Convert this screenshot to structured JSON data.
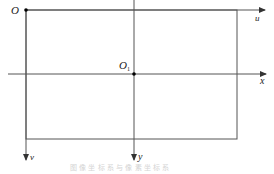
{
  "diagram": {
    "type": "coordinate-systems",
    "origins": [
      {
        "id": "pixel-origin",
        "label": "O",
        "x": 26,
        "y": 10
      },
      {
        "id": "image-origin",
        "label": "O",
        "subscript": "1",
        "x": 134,
        "y": 74
      }
    ],
    "axes": [
      {
        "id": "u-axis",
        "label": "u",
        "direction": "right"
      },
      {
        "id": "v-axis",
        "label": "v",
        "direction": "down"
      },
      {
        "id": "x-axis",
        "label": "x",
        "direction": "right"
      },
      {
        "id": "y-axis",
        "label": "y",
        "direction": "down"
      }
    ],
    "caption": "图 像 坐 标 系 与 像 素 坐 标 系"
  },
  "colors": {
    "line": "#555555",
    "point": "#000000",
    "label": "#222222",
    "caption": "#d4d4d4"
  }
}
